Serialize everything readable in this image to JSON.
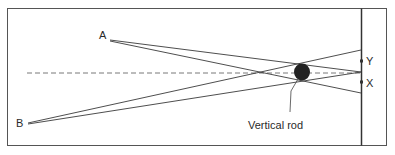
{
  "labels": {
    "point_a": "A",
    "point_b": "B",
    "point_x": "X",
    "point_y": "Y",
    "rod": "Vertical rod"
  },
  "colors": {
    "stroke": "#3a3a3a",
    "rod_fill": "#222222",
    "dashed": "#6a6a6a",
    "frame": "#555555"
  }
}
